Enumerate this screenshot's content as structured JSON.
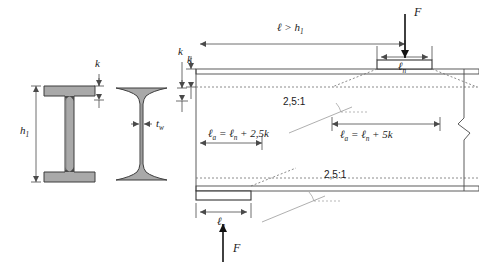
{
  "figure": {
    "colors": {
      "steel_fill": "#a9a9a9",
      "steel_outline": "#3d3d3d",
      "line": "#4a4a4a",
      "dotted": "#6e6e6e",
      "plate_fill": "#ffffff",
      "text": "#1a1a1a"
    }
  },
  "sections": {
    "rolled_profile": {
      "name": "I-profile parallel flange",
      "height_label": "h",
      "height_sub": "1",
      "flange_label": "k"
    },
    "tapered_profile": {
      "name": "I-profile tapered flange",
      "flange_label": "k",
      "web_label": "t",
      "web_sub": "w"
    }
  },
  "elevation": {
    "span_label": "ℓ > h",
    "span_sub": "1",
    "flange_thickness_label": "k",
    "top_force_label": "F",
    "bottom_force_label": "F",
    "top_bearing_label": "ℓ",
    "top_bearing_sub": "n",
    "bottom_bearing_label": "ℓ",
    "bottom_bearing_sub": "n",
    "slope_label_upper": "2,5:1",
    "slope_label_lower": "2,5:1",
    "formula_edge": {
      "lhs": "ℓ",
      "lhs_sub": "a",
      "rhs": "= ℓ",
      "rhs_sub": "n",
      "tail": "+ 2,5k"
    },
    "formula_interior": {
      "lhs": "ℓ",
      "lhs_sub": "a",
      "rhs": "= ℓ",
      "rhs_sub": "n",
      "tail": "+ 5k"
    },
    "break_symbol": "zigzag-break"
  }
}
